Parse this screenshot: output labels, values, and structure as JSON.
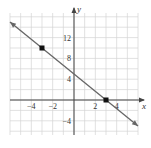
{
  "chart_data": {
    "type": "line",
    "title": "",
    "xlabel": "x",
    "ylabel": "y",
    "xlim": [
      -6,
      6
    ],
    "ylim": [
      -10,
      16
    ],
    "grid": true,
    "x_ticks": [
      -4,
      -2,
      2,
      4
    ],
    "x_tick_labels": [
      "−4",
      "−2",
      "2",
      "4"
    ],
    "y_ticks": [
      -4,
      4,
      8,
      12
    ],
    "y_tick_labels": [
      "−4",
      "4",
      "8",
      "12"
    ],
    "series": [
      {
        "name": "line",
        "equation": "y = -5/3 x + 5",
        "slope": -1.6667,
        "intercept": 5,
        "x": [
          -6,
          6
        ],
        "y": [
          15,
          -5
        ],
        "arrows": "both",
        "color": "#666666"
      }
    ],
    "points": [
      {
        "x": -3,
        "y": 10,
        "label": ""
      },
      {
        "x": 3,
        "y": 0,
        "label": ""
      }
    ]
  }
}
